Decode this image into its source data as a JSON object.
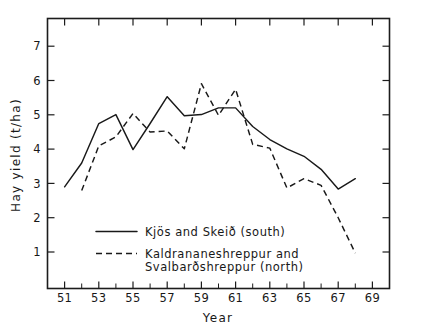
{
  "chart_data": {
    "type": "line",
    "title": "",
    "xlabel": "Year",
    "ylabel": "Hay yield (t/ha)",
    "xlim": [
      50,
      70
    ],
    "ylim": [
      0.35,
      7.6
    ],
    "grid": false,
    "legend_position": "inside-lower-left",
    "x_tick_labels": [
      "51",
      "53",
      "55",
      "57",
      "59",
      "61",
      "63",
      "65",
      "67",
      "69"
    ],
    "x_tick_values": [
      51,
      53,
      55,
      57,
      59,
      61,
      63,
      65,
      67,
      69
    ],
    "x_minor_tick_values": [
      52,
      54,
      56,
      58,
      60,
      62,
      64,
      66,
      68
    ],
    "y_tick_labels": [
      "1",
      "2",
      "3",
      "4",
      "5",
      "6",
      "7"
    ],
    "y_tick_values": [
      1,
      2,
      3,
      4,
      5,
      6,
      7
    ],
    "series": [
      {
        "name": "Kjös and Skeið (south)",
        "style": "solid",
        "color": "#191919",
        "x": [
          51,
          52,
          53,
          54,
          55,
          56,
          57,
          58,
          59,
          60,
          61,
          62,
          63,
          64,
          65,
          66,
          67,
          68
        ],
        "values": [
          3.08,
          3.72,
          4.78,
          5.02,
          4.08,
          4.78,
          5.5,
          4.99,
          5.02,
          5.2,
          5.2,
          4.7,
          4.35,
          4.1,
          3.9,
          3.55,
          3.02,
          3.3
        ]
      },
      {
        "name": "Kaldrananeshreppur and Svalbarðshreppur (north)",
        "style": "dashed",
        "color": "#191919",
        "x": [
          52,
          53,
          54,
          55,
          56,
          57,
          58,
          59,
          60,
          61,
          62,
          63,
          64,
          65,
          66,
          67,
          68
        ],
        "values": [
          2.98,
          4.18,
          4.42,
          5.05,
          4.55,
          4.58,
          4.1,
          5.85,
          5.0,
          5.7,
          4.22,
          4.12,
          3.05,
          3.3,
          3.12,
          2.25,
          1.3
        ]
      }
    ]
  },
  "axes": {
    "y_label": "Hay yield (t/ha)",
    "x_label": "Year"
  },
  "legend": {
    "entries": [
      {
        "style": "solid",
        "line_1": "Kjös and Skeið  (south)",
        "line_2": ""
      },
      {
        "style": "dashed",
        "line_1": "Kaldrananeshreppur and",
        "line_2": "Svalbarðshreppur (north)"
      }
    ]
  }
}
